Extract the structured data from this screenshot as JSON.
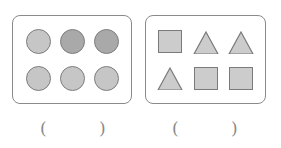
{
  "groups": [
    {
      "name": "circles",
      "shapes": [
        {
          "type": "circle",
          "fill": "#c6c6c6",
          "x": 26,
          "y": 29
        },
        {
          "type": "circle",
          "fill": "#a9a9a9",
          "x": 60,
          "y": 29
        },
        {
          "type": "circle",
          "fill": "#a9a9a9",
          "x": 94,
          "y": 29
        },
        {
          "type": "circle",
          "fill": "#c6c6c6",
          "x": 26,
          "y": 66
        },
        {
          "type": "circle",
          "fill": "#c6c6c6",
          "x": 60,
          "y": 66
        },
        {
          "type": "circle",
          "fill": "#c6c6c6",
          "x": 94,
          "y": 66
        }
      ]
    },
    {
      "name": "squares-and-triangles",
      "shapes": [
        {
          "type": "square",
          "x": 158,
          "y": 30
        },
        {
          "type": "triangle",
          "x": 193,
          "y": 31
        },
        {
          "type": "triangle",
          "x": 228,
          "y": 31
        },
        {
          "type": "triangle",
          "x": 157,
          "y": 67
        },
        {
          "type": "square",
          "x": 194,
          "y": 67
        },
        {
          "type": "square",
          "x": 229,
          "y": 67
        }
      ]
    }
  ],
  "answers": {
    "open": "(",
    "close": ")",
    "blank_a": "",
    "blank_b": ""
  }
}
